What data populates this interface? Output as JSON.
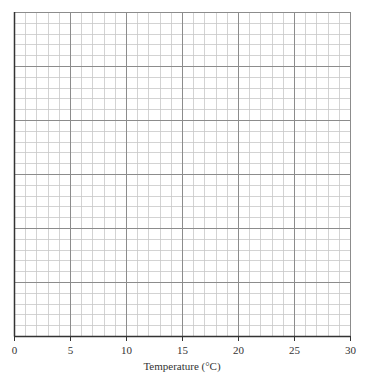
{
  "chart_data": {
    "type": "line",
    "title": "",
    "xlabel": "Temperature (°C)",
    "ylabel": "",
    "xlim": [
      0,
      30
    ],
    "x_ticks": [
      0,
      5,
      10,
      15,
      20,
      25,
      30
    ],
    "x_tick_labels": [
      "0",
      "5",
      "10",
      "15",
      "20",
      "25",
      "30"
    ],
    "y_ticks": [],
    "grid": true,
    "grid_minor_step_x": 1,
    "grid_major_step_x": 5,
    "grid_minor_rows": 30,
    "grid_major_every_rows": 5,
    "series": [],
    "legend": null
  },
  "colors": {
    "minor_grid": "#c8c8c8",
    "major_grid": "#8c8c8c",
    "axis": "#333333",
    "text": "#333333"
  },
  "layout": {
    "plot_left": 14,
    "plot_top": 12,
    "plot_right": 350,
    "plot_bottom": 336
  }
}
